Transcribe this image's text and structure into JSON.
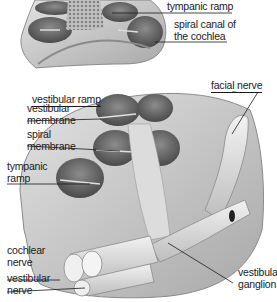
{
  "diagram": {
    "colors": {
      "bone": "#cfcfcf",
      "bone_dark": "#9a9a9a",
      "cavity": "#6e6e6e",
      "nerve": "#e4e4e4",
      "line": "#1a1a1a"
    },
    "top_labels": {
      "tympanic_ramp": "tympanic ramp",
      "spiral_canal_line1": "spiral canal of",
      "spiral_canal_line2": "the cochlea"
    },
    "main_labels": {
      "vestibular_ramp": "vestibular ramp",
      "facial_nerve": "facial nerve",
      "vestibular_membrane_line1": "vestibular",
      "vestibular_membrane_line2": "membrane",
      "spiral_membrane_line1": "spiral",
      "spiral_membrane_line2": "membrane",
      "tympanic_ramp_line1": "tympanic",
      "tympanic_ramp_line2": "ramp",
      "cochlear_nerve_line1": "cochlear",
      "cochlear_nerve_line2": "nerve",
      "vestibular_nerve_line1": "vestibular",
      "vestibular_nerve_line2": "nerve",
      "vestibular_ganglion_line1": "vestibular",
      "vestibular_ganglion_line2": "ganglion"
    }
  }
}
